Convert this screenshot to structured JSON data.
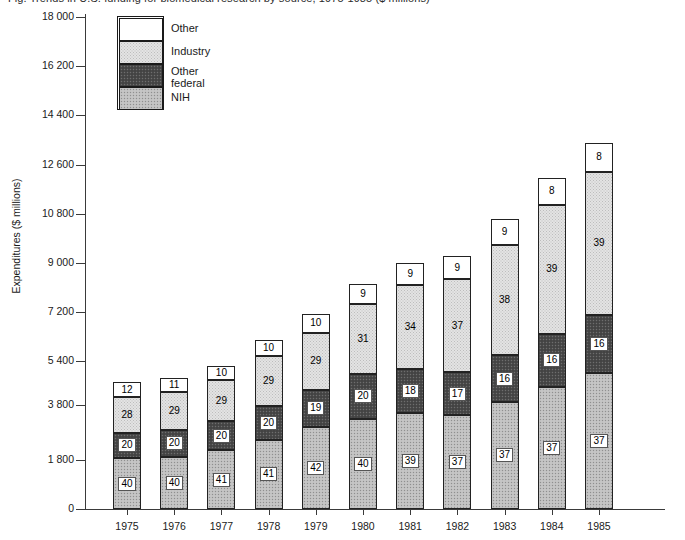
{
  "title_clipped": "Fig.  Trends in U.S. funding for biomedical research by source, 1975-1985 ($ millions)",
  "axis": {
    "ylabel": "Expenditures ($ millions)",
    "yticks": [
      "18 000",
      "16 200",
      "14 400",
      "12 600",
      "10 800",
      "9 000",
      "7 200",
      "5 400",
      "3 800",
      "1 800",
      "0"
    ],
    "xlabel": ""
  },
  "legend": {
    "items": [
      {
        "label": "Other",
        "key": "other",
        "swatch": "white-blank"
      },
      {
        "label": "Industry",
        "key": "industry",
        "swatch": "light-stipple"
      },
      {
        "label": "Other\nfederal",
        "key": "other_federal",
        "swatch": "dark-stipple"
      },
      {
        "label": "NIH",
        "key": "nih",
        "swatch": "medium-stipple"
      }
    ]
  },
  "colors": {
    "other": "#ffffff",
    "industry": "#e3e3e3",
    "other_federal": "#4a4a4a",
    "nih": "#bfbfbf",
    "axis": "#3a3a3a",
    "text": "#1a1a1a"
  },
  "chart_data": {
    "type": "bar",
    "title": "",
    "subtype": "stacked-bar-percent-labels",
    "xlabel": "",
    "ylabel": "Expenditures ($ millions)",
    "ylim": [
      0,
      18000
    ],
    "ytick_values": [
      18000,
      16200,
      14400,
      12600,
      10800,
      9000,
      7200,
      5400,
      3800,
      1800,
      0
    ],
    "ytick_labels": [
      "18 000",
      "16 200",
      "14 400",
      "12 600",
      "10 800",
      "9 000",
      "7 200",
      "5 400",
      "3 800",
      "1 800",
      "0"
    ],
    "grid": false,
    "legend_position": "top-left",
    "categories": [
      "1975",
      "1976",
      "1977",
      "1978",
      "1979",
      "1980",
      "1981",
      "1982",
      "1983",
      "1984",
      "1985"
    ],
    "stack_order_bottom_to_top": [
      "NIH",
      "Other federal",
      "Industry",
      "Other"
    ],
    "label_units": "percent of total",
    "series": [
      {
        "name": "NIH",
        "values": [
          40,
          40,
          41,
          41,
          42,
          40,
          39,
          37,
          37,
          37,
          37
        ]
      },
      {
        "name": "Other federal",
        "values": [
          20,
          20,
          20,
          20,
          19,
          20,
          18,
          17,
          16,
          16,
          16
        ]
      },
      {
        "name": "Industry",
        "values": [
          28,
          29,
          29,
          29,
          29,
          31,
          34,
          37,
          38,
          39,
          39
        ]
      },
      {
        "name": "Other",
        "values": [
          12,
          11,
          10,
          10,
          10,
          9,
          9,
          9,
          9,
          8,
          8
        ]
      }
    ],
    "totals_dollars": [
      4650,
      4800,
      5250,
      6200,
      7150,
      8250,
      9000,
      9250,
      10600,
      12100,
      13400
    ]
  },
  "bars": [
    {
      "year": "1975",
      "total": 4650,
      "segs": [
        {
          "k": "nih",
          "v": "40"
        },
        {
          "k": "otherfed",
          "v": "20"
        },
        {
          "k": "industry",
          "v": "28"
        },
        {
          "k": "other",
          "v": "12"
        }
      ]
    },
    {
      "year": "1976",
      "total": 4800,
      "segs": [
        {
          "k": "nih",
          "v": "40"
        },
        {
          "k": "otherfed",
          "v": "20"
        },
        {
          "k": "industry",
          "v": "29"
        },
        {
          "k": "other",
          "v": "11"
        }
      ]
    },
    {
      "year": "1977",
      "total": 5250,
      "segs": [
        {
          "k": "nih",
          "v": "41"
        },
        {
          "k": "otherfed",
          "v": "20"
        },
        {
          "k": "industry",
          "v": "29"
        },
        {
          "k": "other",
          "v": "10"
        }
      ]
    },
    {
      "year": "1978",
      "total": 6200,
      "segs": [
        {
          "k": "nih",
          "v": "41"
        },
        {
          "k": "otherfed",
          "v": "20"
        },
        {
          "k": "industry",
          "v": "29"
        },
        {
          "k": "other",
          "v": "10"
        }
      ]
    },
    {
      "year": "1979",
      "total": 7150,
      "segs": [
        {
          "k": "nih",
          "v": "42"
        },
        {
          "k": "otherfed",
          "v": "19"
        },
        {
          "k": "industry",
          "v": "29"
        },
        {
          "k": "other",
          "v": "10"
        }
      ]
    },
    {
      "year": "1980",
      "total": 8250,
      "segs": [
        {
          "k": "nih",
          "v": "40"
        },
        {
          "k": "otherfed",
          "v": "20"
        },
        {
          "k": "industry",
          "v": "31"
        },
        {
          "k": "other",
          "v": "9"
        }
      ]
    },
    {
      "year": "1981",
      "total": 9000,
      "segs": [
        {
          "k": "nih",
          "v": "39"
        },
        {
          "k": "otherfed",
          "v": "18"
        },
        {
          "k": "industry",
          "v": "34"
        },
        {
          "k": "other",
          "v": "9"
        }
      ]
    },
    {
      "year": "1982",
      "total": 9250,
      "segs": [
        {
          "k": "nih",
          "v": "37"
        },
        {
          "k": "otherfed",
          "v": "17"
        },
        {
          "k": "industry",
          "v": "37"
        },
        {
          "k": "other",
          "v": "9"
        }
      ]
    },
    {
      "year": "1983",
      "total": 10600,
      "segs": [
        {
          "k": "nih",
          "v": "37"
        },
        {
          "k": "otherfed",
          "v": "16"
        },
        {
          "k": "industry",
          "v": "38"
        },
        {
          "k": "other",
          "v": "9"
        }
      ]
    },
    {
      "year": "1984",
      "total": 12100,
      "segs": [
        {
          "k": "nih",
          "v": "37"
        },
        {
          "k": "otherfed",
          "v": "16"
        },
        {
          "k": "industry",
          "v": "39"
        },
        {
          "k": "other",
          "v": "8"
        }
      ]
    },
    {
      "year": "1985",
      "total": 13400,
      "segs": [
        {
          "k": "nih",
          "v": "37"
        },
        {
          "k": "otherfed",
          "v": "16"
        },
        {
          "k": "industry",
          "v": "39"
        },
        {
          "k": "other",
          "v": "8"
        }
      ]
    }
  ]
}
